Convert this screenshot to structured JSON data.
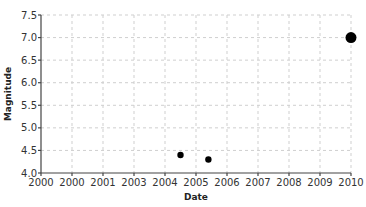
{
  "chart_data": {
    "type": "scatter",
    "title": "",
    "xlabel": "Date",
    "ylabel": "Magnitude",
    "xlim": [
      2000,
      2010
    ],
    "ylim": [
      4.0,
      7.5
    ],
    "grid": true,
    "legend": null,
    "x_tick_labels": [
      "2000",
      "2000",
      "2001",
      "2003",
      "2004",
      "2005",
      "2006",
      "2007",
      "2008",
      "2009",
      "2010"
    ],
    "y_tick_labels": [
      "4.0",
      "4.5",
      "5.0",
      "5.5",
      "6.0",
      "6.5",
      "7.0",
      "7.5"
    ],
    "points": [
      {
        "x": 2004.5,
        "y": 4.4,
        "size": "small"
      },
      {
        "x": 2005.4,
        "y": 4.3,
        "size": "small"
      },
      {
        "x": 2010.0,
        "y": 7.0,
        "size": "large"
      }
    ],
    "point_color": "#000000"
  }
}
